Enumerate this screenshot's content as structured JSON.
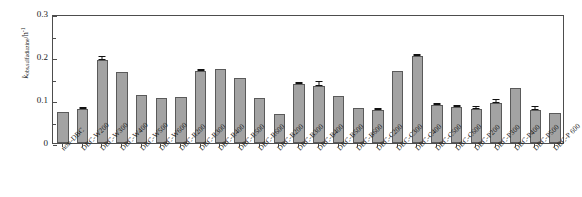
{
  "chart_data": {
    "type": "bar",
    "title": "",
    "xlabel": "",
    "ylabel": "k_obs,sulfadiazine / h^-1",
    "ylabel_parts": {
      "symbol": "k",
      "subscript": "obs,sulfadiazine",
      "divider": "/h",
      "superscript": "-1"
    },
    "ylim": [
      0,
      0.3
    ],
    "ytick_labels": [
      "0",
      "0.1",
      "0.2",
      "0.3"
    ],
    "ytick_values": [
      0,
      0.1,
      0.2,
      0.3
    ],
    "yminor_values": [
      0.05,
      0.15,
      0.25
    ],
    "grid": false,
    "legend": false,
    "bar_color": "#a3a3a3",
    "bar_edge_color": "#5a5a5a",
    "error_color": "#111111",
    "axis_color": "#4d4d4d",
    "categories": [
      "non-DBC",
      "DBC-W200",
      "DBC-W300",
      "DBC-W400",
      "DBC-W500",
      "DBC-W600",
      "DBC-R200",
      "DBC-R300",
      "DBC-R400",
      "DBC-R500",
      "DBC-R600",
      "DBC-B200",
      "DBC-B300",
      "DBC-B400",
      "DBC-B500",
      "DBC-B600",
      "DBC-C200",
      "DBC-C300",
      "DBC-C400",
      "DBC-C500",
      "DBC-C600",
      "DBC-P200",
      "DBC-P300",
      "DBC-P400",
      "DBC-P500",
      "DBC-P 600"
    ],
    "values": [
      0.072,
      0.079,
      0.192,
      0.165,
      0.111,
      0.105,
      0.108,
      0.167,
      0.172,
      0.152,
      0.105,
      0.068,
      0.138,
      0.132,
      0.11,
      0.081,
      0.077,
      0.168,
      0.202,
      0.088,
      0.083,
      0.08,
      0.094,
      0.129,
      0.077,
      0.069
    ],
    "errors": [
      0.0,
      0.002,
      0.009,
      0.0,
      0.0,
      0.0,
      0.0,
      0.002,
      0.0,
      0.0,
      0.0,
      0.0,
      0.002,
      0.009,
      0.0,
      0.0,
      0.002,
      0.0,
      0.002,
      0.003,
      0.002,
      0.003,
      0.005,
      0.0,
      0.007,
      0.0
    ]
  }
}
